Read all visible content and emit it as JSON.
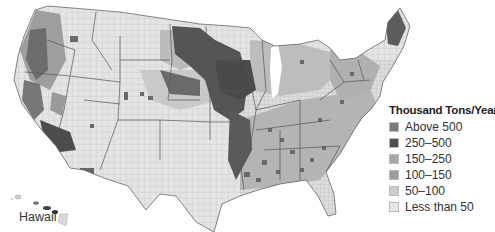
{
  "map": {
    "region": "Contiguous United States (county level)",
    "inset_label": "Hawaii",
    "border_color": "#555555",
    "county_line_color": "#9a9a9a"
  },
  "legend": {
    "title": "Thousand Tons/Year",
    "items": [
      {
        "label": "Above 500",
        "color": "#7a7a7a"
      },
      {
        "label": "250–500",
        "color": "#4f4f4f"
      },
      {
        "label": "150–250",
        "color": "#a8a8a8"
      },
      {
        "label": "100–150",
        "color": "#9c9c9c"
      },
      {
        "label": "50–100",
        "color": "#cdcdcd"
      },
      {
        "label": "Less than 50",
        "color": "#e6e6e6"
      }
    ]
  }
}
